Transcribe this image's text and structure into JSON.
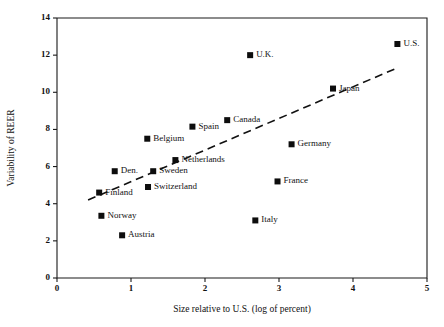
{
  "chart_data": {
    "type": "scatter",
    "title": "",
    "xlabel": "Size relative to U.S. (log of percent)",
    "ylabel": "Variability of REER",
    "xlim": [
      0,
      5
    ],
    "ylim": [
      0,
      14
    ],
    "xticks": [
      "0",
      "1",
      "2",
      "3",
      "4",
      "5"
    ],
    "yticks": [
      "0",
      "2",
      "4",
      "6",
      "8",
      "10",
      "12",
      "14"
    ],
    "grid": false,
    "legend": "none",
    "marker_color": "#0d0d0d",
    "trendline_color": "#111111",
    "points": [
      {
        "label": "U.S.",
        "x": 4.6,
        "y": 12.6
      },
      {
        "label": "U.K.",
        "x": 2.61,
        "y": 12.0
      },
      {
        "label": "Japan",
        "x": 3.73,
        "y": 10.2
      },
      {
        "label": "Canada",
        "x": 2.3,
        "y": 8.5
      },
      {
        "label": "Spain",
        "x": 1.83,
        "y": 8.15
      },
      {
        "label": "Belgium",
        "x": 1.22,
        "y": 7.5
      },
      {
        "label": "Germany",
        "x": 3.17,
        "y": 7.2
      },
      {
        "label": "Netherlands",
        "x": 1.6,
        "y": 6.35
      },
      {
        "label": "Den.",
        "x": 0.78,
        "y": 5.75
      },
      {
        "label": "Sweden",
        "x": 1.3,
        "y": 5.75
      },
      {
        "label": "France",
        "x": 2.98,
        "y": 5.2
      },
      {
        "label": "Switzerland",
        "x": 1.23,
        "y": 4.9
      },
      {
        "label": "Finland",
        "x": 0.57,
        "y": 4.6
      },
      {
        "label": "Norway",
        "x": 0.6,
        "y": 3.35
      },
      {
        "label": "Austria",
        "x": 0.88,
        "y": 2.3
      },
      {
        "label": "Italy",
        "x": 2.68,
        "y": 3.1
      }
    ],
    "trendline": {
      "x0": 0.42,
      "y0": 4.2,
      "x1": 4.62,
      "y1": 11.35
    }
  }
}
